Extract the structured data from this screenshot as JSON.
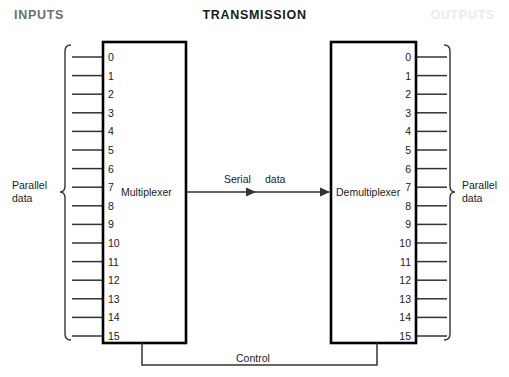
{
  "figure": {
    "headers": {
      "inputs": "INPUTS",
      "transmission": "TRANSMISSION",
      "outputs": "OUTPUTS"
    },
    "colors": {
      "inputs_header": "#6e6e6e",
      "transmission_header": "#1a1a1a",
      "outputs_header": "#ebebeb",
      "box_stroke": "#000000",
      "line_stroke": "#333333",
      "background": "#ffffff"
    },
    "blocks": {
      "multiplexer": {
        "label": "Multiplexer",
        "pins": [
          "0",
          "1",
          "2",
          "3",
          "4",
          "5",
          "6",
          "7",
          "8",
          "9",
          "10",
          "11",
          "12",
          "13",
          "14",
          "15"
        ]
      },
      "demultiplexer": {
        "label": "Demultiplexer",
        "pins": [
          "0",
          "1",
          "2",
          "3",
          "4",
          "5",
          "6",
          "7",
          "8",
          "9",
          "10",
          "11",
          "12",
          "13",
          "14",
          "15"
        ]
      }
    },
    "braces": {
      "left": {
        "label_line1": "Parallel",
        "label_line2": "data"
      },
      "right": {
        "label_line1": "Parallel",
        "label_line2": "data"
      }
    },
    "links": {
      "serial": {
        "label_word1": "Serial",
        "label_word2": "data"
      },
      "control": {
        "label": "Control"
      }
    }
  },
  "chart_data": {
    "type": "diagram",
    "title": "TRANSMISSION",
    "nodes": [
      {
        "id": "multiplexer",
        "label": "Multiplexer",
        "inputs": 16,
        "outputs": 1
      },
      {
        "id": "demultiplexer",
        "label": "Demultiplexer",
        "inputs": 1,
        "outputs": 16
      }
    ],
    "edges": [
      {
        "from": "multiplexer",
        "to": "demultiplexer",
        "label": "Serial data",
        "directed": true
      },
      {
        "from": "multiplexer",
        "to": "demultiplexer",
        "label": "Control",
        "directed": false
      }
    ],
    "channel_labels": [
      "0",
      "1",
      "2",
      "3",
      "4",
      "5",
      "6",
      "7",
      "8",
      "9",
      "10",
      "11",
      "12",
      "13",
      "14",
      "15"
    ]
  }
}
